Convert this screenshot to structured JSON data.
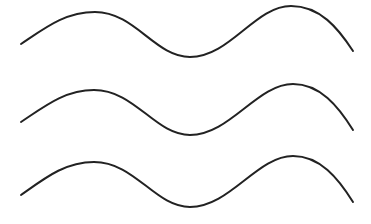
{
  "figure": {
    "line_count": 3,
    "colors": {
      "background": "#ffffff",
      "stroke": "#222222"
    }
  }
}
